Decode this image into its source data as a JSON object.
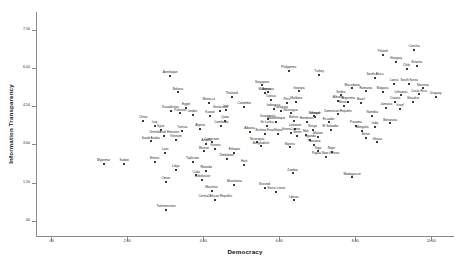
{
  "chart_data": {
    "type": "scatter",
    "title": "",
    "xlabel": "Democracy",
    "ylabel": "Information Transparency",
    "xlim": [
      -0.4,
      10.6
    ],
    "ylim": [
      -0.6,
      8.2
    ],
    "grid": false,
    "legend": null,
    "xticks": [
      {
        "value": 0,
        "label": ".00"
      },
      {
        "value": 2,
        "label": "2.00"
      },
      {
        "value": 4,
        "label": "4.00"
      },
      {
        "value": 6,
        "label": "6.00"
      },
      {
        "value": 8,
        "label": "8.00"
      },
      {
        "value": 10,
        "label": "10.00"
      }
    ],
    "yticks": [
      {
        "value": 0,
        "label": ".00"
      },
      {
        "value": 1.5,
        "label": "1.50"
      },
      {
        "value": 3,
        "label": "3.00"
      },
      {
        "value": 4.5,
        "label": "4.50"
      },
      {
        "value": 6,
        "label": "6.00"
      },
      {
        "value": 7.5,
        "label": "7.50"
      }
    ],
    "point_label_field": "country",
    "points": [
      {
        "country": "Azerbaijan",
        "x": 3.13,
        "y": 5.68
      },
      {
        "country": "Belarus",
        "x": 3.34,
        "y": 5.04
      },
      {
        "country": "Morocco",
        "x": 4.15,
        "y": 4.64
      },
      {
        "country": "Kazakhstan",
        "x": 3.14,
        "y": 4.33
      },
      {
        "country": "Egypt",
        "x": 3.55,
        "y": 4.42
      },
      {
        "country": "Iran",
        "x": 4.6,
        "y": 4.36
      },
      {
        "country": "Jordan",
        "x": 3.72,
        "y": 4.16
      },
      {
        "country": "Venezuela",
        "x": 4.45,
        "y": 4.31
      },
      {
        "country": "Thailand",
        "x": 4.75,
        "y": 4.86
      },
      {
        "country": "Singapore",
        "x": 5.55,
        "y": 5.32
      },
      {
        "country": "Malaysia",
        "x": 5.62,
        "y": 5.02
      },
      {
        "country": "Philippines",
        "x": 6.25,
        "y": 5.88
      },
      {
        "country": "Turkey",
        "x": 7.05,
        "y": 5.72
      },
      {
        "country": "Georgia",
        "x": 6.52,
        "y": 5.08
      },
      {
        "country": "Armenia",
        "x": 5.7,
        "y": 5.04
      },
      {
        "country": "Tunisia",
        "x": 5.78,
        "y": 4.76
      },
      {
        "country": "Moldova",
        "x": 6.45,
        "y": 4.66
      },
      {
        "country": "Peru",
        "x": 6.2,
        "y": 4.62
      },
      {
        "country": "Indonesia",
        "x": 5.85,
        "y": 4.38
      },
      {
        "country": "Colombia",
        "x": 5.08,
        "y": 4.48
      },
      {
        "country": "Paraguay",
        "x": 6.05,
        "y": 4.3
      },
      {
        "country": "Macedonia",
        "x": 7.92,
        "y": 5.2
      },
      {
        "country": "Romania",
        "x": 8.28,
        "y": 5.08
      },
      {
        "country": "Serbia",
        "x": 7.62,
        "y": 4.92
      },
      {
        "country": "Albania",
        "x": 7.55,
        "y": 4.7
      },
      {
        "country": "Argentina",
        "x": 7.82,
        "y": 4.66
      },
      {
        "country": "Brazil",
        "x": 8.15,
        "y": 4.62
      },
      {
        "country": "Mexico",
        "x": 7.7,
        "y": 4.5
      },
      {
        "country": "Poland",
        "x": 8.72,
        "y": 6.52
      },
      {
        "country": "Czechia",
        "x": 9.55,
        "y": 6.72
      },
      {
        "country": "Hungary",
        "x": 9.08,
        "y": 6.24
      },
      {
        "country": "Estonia",
        "x": 9.62,
        "y": 6.08
      },
      {
        "country": "Chile",
        "x": 9.35,
        "y": 5.96
      },
      {
        "country": "South Africa",
        "x": 8.52,
        "y": 5.62
      },
      {
        "country": "Latvia",
        "x": 9.02,
        "y": 5.38
      },
      {
        "country": "South Korea",
        "x": 9.42,
        "y": 5.36
      },
      {
        "country": "Slovenia",
        "x": 9.78,
        "y": 5.2
      },
      {
        "country": "Bulgaria",
        "x": 8.72,
        "y": 5.06
      },
      {
        "country": "Lithuania",
        "x": 9.2,
        "y": 4.92
      },
      {
        "country": "Costa Rica",
        "x": 9.68,
        "y": 4.96
      },
      {
        "country": "Uruguay",
        "x": 10.12,
        "y": 4.88
      },
      {
        "country": "Croatia",
        "x": 9.05,
        "y": 4.68
      },
      {
        "country": "Slovakia",
        "x": 9.52,
        "y": 4.66
      },
      {
        "country": "Ukraine",
        "x": 6.95,
        "y": 4.08
      },
      {
        "country": "Nicaragua",
        "x": 6.3,
        "y": 4.22
      },
      {
        "country": "Senegal",
        "x": 6.92,
        "y": 4.1
      },
      {
        "country": "Dominican Republic",
        "x": 7.55,
        "y": 4.18
      },
      {
        "country": "Namibia",
        "x": 8.45,
        "y": 4.12
      },
      {
        "country": "Guatemala",
        "x": 5.7,
        "y": 3.98
      },
      {
        "country": "Mozambique",
        "x": 5.92,
        "y": 3.88
      },
      {
        "country": "Bolivia",
        "x": 6.38,
        "y": 3.92
      },
      {
        "country": "Honduras",
        "x": 6.72,
        "y": 3.88
      },
      {
        "country": "Ecuador",
        "x": 7.3,
        "y": 3.86
      },
      {
        "country": "Botswana",
        "x": 8.92,
        "y": 3.82
      },
      {
        "country": "Sri Lanka",
        "x": 5.68,
        "y": 3.72
      },
      {
        "country": "Panama",
        "x": 8.02,
        "y": 3.72
      },
      {
        "country": "India",
        "x": 8.52,
        "y": 3.68
      },
      {
        "country": "Lebanon",
        "x": 6.42,
        "y": 3.62
      },
      {
        "country": "Kenya",
        "x": 6.88,
        "y": 3.58
      },
      {
        "country": "El Salvador",
        "x": 7.35,
        "y": 3.58
      },
      {
        "country": "Mongolia",
        "x": 8.18,
        "y": 3.52
      },
      {
        "country": "Albania2",
        "x": 5.22,
        "y": 3.48
      },
      {
        "country": "Nepal",
        "x": 5.98,
        "y": 3.42
      },
      {
        "country": "Sierra Leone2",
        "x": 6.32,
        "y": 3.46
      },
      {
        "country": "Burkina Faso",
        "x": 5.62,
        "y": 3.4
      },
      {
        "country": "Mali",
        "x": 6.7,
        "y": 3.36
      },
      {
        "country": "Benin",
        "x": 6.48,
        "y": 3.32
      },
      {
        "country": "Malawi",
        "x": 7.02,
        "y": 3.3
      },
      {
        "country": "Uganda",
        "x": 6.82,
        "y": 3.18
      },
      {
        "country": "Tanzania",
        "x": 6.92,
        "y": 2.98
      },
      {
        "country": "Nigeria",
        "x": 6.28,
        "y": 2.88
      },
      {
        "country": "Ghana",
        "x": 8.58,
        "y": 3.08
      },
      {
        "country": "Benin2",
        "x": 8.28,
        "y": 3.26
      },
      {
        "country": "Ethiopia",
        "x": 4.82,
        "y": 2.66
      },
      {
        "country": "Guinea",
        "x": 4.32,
        "y": 2.82
      },
      {
        "country": "Zimbabwe",
        "x": 4.62,
        "y": 2.42
      },
      {
        "country": "Angola",
        "x": 4.08,
        "y": 3.02
      },
      {
        "country": "Bhutan",
        "x": 4.02,
        "y": 2.72
      },
      {
        "country": "Vietnam",
        "x": 3.28,
        "y": 3.18
      },
      {
        "country": "Saudi Arabia",
        "x": 2.62,
        "y": 3.12
      },
      {
        "country": "Laos",
        "x": 3.0,
        "y": 2.68
      },
      {
        "country": "United Arab Emirates",
        "x": 2.98,
        "y": 3.32
      },
      {
        "country": "Eritrea",
        "x": 2.72,
        "y": 2.3
      },
      {
        "country": "Tajikistan",
        "x": 3.72,
        "y": 2.32
      },
      {
        "country": "Libya",
        "x": 3.28,
        "y": 2.0
      },
      {
        "country": "Rwanda",
        "x": 4.08,
        "y": 1.96
      },
      {
        "country": "Cuba",
        "x": 3.82,
        "y": 1.78
      },
      {
        "country": "Uzbekistan",
        "x": 3.98,
        "y": 1.6
      },
      {
        "country": "Oman",
        "x": 3.02,
        "y": 1.52
      },
      {
        "country": "Myanmar",
        "x": 1.38,
        "y": 2.22
      },
      {
        "country": "Sudan",
        "x": 1.92,
        "y": 2.22
      },
      {
        "country": "Turkmenistan",
        "x": 3.02,
        "y": 0.42
      },
      {
        "country": "Central African Republic",
        "x": 4.32,
        "y": 0.82
      },
      {
        "country": "Liberia",
        "x": 6.38,
        "y": 0.8
      },
      {
        "country": "Mauritania",
        "x": 4.82,
        "y": 1.42
      },
      {
        "country": "Haiti",
        "x": 5.08,
        "y": 2.18
      },
      {
        "country": "Zambia",
        "x": 6.35,
        "y": 1.86
      },
      {
        "country": "Madagascar",
        "x": 7.92,
        "y": 1.7
      },
      {
        "country": "Burundi",
        "x": 5.62,
        "y": 1.28
      },
      {
        "country": "Sierra Leone",
        "x": 5.92,
        "y": 1.12
      },
      {
        "country": "Papua New Guinea",
        "x": 7.22,
        "y": 2.52
      },
      {
        "country": "Togo",
        "x": 7.02,
        "y": 2.72
      },
      {
        "country": "Niger",
        "x": 7.38,
        "y": 2.7
      },
      {
        "country": "China",
        "x": 2.42,
        "y": 3.92
      },
      {
        "country": "Iraq",
        "x": 2.72,
        "y": 3.72
      },
      {
        "country": "Syria",
        "x": 2.88,
        "y": 3.58
      },
      {
        "country": "Algeria",
        "x": 3.92,
        "y": 3.6
      },
      {
        "country": "Cambodia",
        "x": 4.48,
        "y": 3.72
      },
      {
        "country": "Tunisia2",
        "x": 3.45,
        "y": 3.52
      },
      {
        "country": "Kuwait",
        "x": 4.18,
        "y": 4.12
      },
      {
        "country": "Pakistan",
        "x": 3.4,
        "y": 4.22
      },
      {
        "country": "Qatar",
        "x": 4.58,
        "y": 3.92
      },
      {
        "country": "Bangladesh",
        "x": 5.52,
        "y": 2.92
      },
      {
        "country": "Nicaragua2",
        "x": 5.42,
        "y": 3.08
      },
      {
        "country": "Mauritius",
        "x": 4.22,
        "y": 1.18
      },
      {
        "country": "Cameroon",
        "x": 4.22,
        "y": 3.08
      },
      {
        "country": "Jamaica",
        "x": 8.82,
        "y": 4.42
      },
      {
        "country": "Israel",
        "x": 9.18,
        "y": 4.38
      }
    ]
  }
}
